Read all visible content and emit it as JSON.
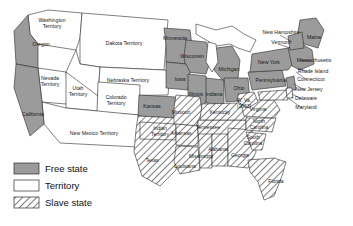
{
  "map": {
    "title": "United States free states, territories and slave states",
    "background_color": "#ffffff",
    "outline_color": "#2b2b2b"
  },
  "legend": {
    "items": [
      {
        "label": "Free state",
        "fill": "#9b9b9b",
        "pattern": "solid-gray"
      },
      {
        "label": "Territory",
        "fill": "#ffffff",
        "pattern": "solid-white"
      },
      {
        "label": "Slave state",
        "fill": "#ffffff",
        "pattern": "diagonal-hatch"
      }
    ]
  },
  "regions": {
    "free_states": [
      {
        "name": "Oregon",
        "label": "Oregon",
        "x": 41,
        "y": 45,
        "lines": [
          "Oregon"
        ]
      },
      {
        "name": "California",
        "label": "California",
        "x": 33,
        "y": 115,
        "lines": [
          "California"
        ]
      },
      {
        "name": "Kansas",
        "label": "Kansas",
        "x": 152,
        "y": 107,
        "lines": [
          "Kansas"
        ]
      },
      {
        "name": "Minnesota",
        "label": "Minnesota",
        "x": 175,
        "y": 39,
        "lines": [
          "Minnesota"
        ]
      },
      {
        "name": "Wisconsin",
        "label": "Wisconsin",
        "x": 192,
        "y": 57,
        "lines": [
          "Wisconsin"
        ]
      },
      {
        "name": "Iowa",
        "label": "Iowa",
        "x": 180,
        "y": 80,
        "lines": [
          "Iowa"
        ]
      },
      {
        "name": "Illinois",
        "label": "Illinois",
        "x": 196,
        "y": 95,
        "lines": [
          "Illinois"
        ]
      },
      {
        "name": "Michigan",
        "label": "Michigan",
        "x": 229,
        "y": 70,
        "lines": [
          "Michigan"
        ]
      },
      {
        "name": "Indiana",
        "label": "Indiana",
        "x": 214,
        "y": 95,
        "lines": [
          "Indiana"
        ]
      },
      {
        "name": "Ohio",
        "label": "Ohio",
        "x": 239,
        "y": 89,
        "lines": [
          "Ohio"
        ]
      },
      {
        "name": "Pennsylvania",
        "label": "Pennsylvania",
        "x": 271,
        "y": 81,
        "lines": [
          "Pennsylvania"
        ]
      },
      {
        "name": "New York",
        "label": "New York",
        "x": 269,
        "y": 63,
        "lines": [
          "New York"
        ]
      },
      {
        "name": "Maine",
        "label": "Maine",
        "x": 314,
        "y": 38,
        "lines": [
          "Maine"
        ]
      },
      {
        "name": "New Hampshire",
        "label": "New Hampshire"
      },
      {
        "name": "Vermont",
        "label": "Vermont"
      },
      {
        "name": "Massachusetts",
        "label": "Massachusetts"
      },
      {
        "name": "Rhode Island",
        "label": "Rhode Island"
      },
      {
        "name": "Connecticut",
        "label": "Connecticut"
      },
      {
        "name": "New Jersey",
        "label": "New Jersey"
      }
    ],
    "territories": [
      {
        "name": "Washington Territory",
        "lines": [
          "Washington",
          "Territory"
        ],
        "x": 52,
        "y": 24
      },
      {
        "name": "Dakota Territory",
        "lines": [
          "Dakota Territory"
        ],
        "x": 124,
        "y": 44
      },
      {
        "name": "Nebraska Territory",
        "lines": [
          "Nebraska Territory"
        ],
        "x": 128,
        "y": 81
      },
      {
        "name": "Nevada Territory",
        "lines": [
          "Nevada",
          "Territory"
        ],
        "x": 50,
        "y": 82
      },
      {
        "name": "Utah Territory",
        "lines": [
          "Utah",
          "Territory"
        ],
        "x": 78,
        "y": 92
      },
      {
        "name": "Colorado Territory",
        "lines": [
          "Colorado",
          "Territory"
        ],
        "x": 116,
        "y": 101
      },
      {
        "name": "New Mexico Territory",
        "lines": [
          "New Mexico Territory"
        ],
        "x": 94,
        "y": 134
      }
    ],
    "slave_states": [
      {
        "name": "Texas",
        "label": "Texas",
        "x": 152,
        "y": 161,
        "lines": [
          "Texas"
        ]
      },
      {
        "name": "Indian Territory",
        "lines": [
          "Indian",
          "Territory"
        ],
        "x": 160,
        "y": 132
      },
      {
        "name": "Missouri",
        "label": "Missouri",
        "x": 181,
        "y": 113,
        "lines": [
          "Missouri"
        ]
      },
      {
        "name": "Arkansas",
        "label": "Arkansas",
        "x": 181,
        "y": 134,
        "lines": [
          "Arkansas"
        ]
      },
      {
        "name": "Louisiana",
        "label": "Louisiana",
        "x": 185,
        "y": 167,
        "lines": [
          "Louisiana"
        ]
      },
      {
        "name": "Mississippi",
        "label": "Mississippi",
        "x": 201,
        "y": 157,
        "lines": [
          "Mississippi"
        ]
      },
      {
        "name": "Alabama",
        "label": "Alabama",
        "x": 218,
        "y": 150,
        "lines": [
          "Alabama"
        ]
      },
      {
        "name": "Tennessee",
        "label": "Tennessee",
        "x": 208,
        "y": 128,
        "lines": [
          "Tennessee"
        ]
      },
      {
        "name": "Kentucky",
        "label": "Kentucky",
        "x": 220,
        "y": 113,
        "lines": [
          "Kentucky"
        ]
      },
      {
        "name": "Georgia",
        "label": "Georgia",
        "x": 240,
        "y": 156,
        "lines": [
          "Georgia"
        ]
      },
      {
        "name": "Florida",
        "label": "Florida",
        "x": 276,
        "y": 182,
        "lines": [
          "Florida"
        ]
      },
      {
        "name": "South Carolina",
        "lines": [
          "South",
          "Carolina"
        ],
        "x": 253,
        "y": 141
      },
      {
        "name": "North Carolina",
        "lines": [
          "North",
          "Carolina"
        ],
        "x": 259,
        "y": 125
      },
      {
        "name": "Virginia",
        "label": "Virginia",
        "x": 258,
        "y": 110,
        "lines": [
          "Virginia"
        ]
      },
      {
        "name": "West Virginia",
        "lines": [
          "W. Va.",
          "(1863)"
        ],
        "x": 244,
        "y": 104
      },
      {
        "name": "Delaware",
        "label": "Delaware"
      },
      {
        "name": "Maryland",
        "label": "Maryland"
      }
    ]
  },
  "callout_labels": [
    {
      "name": "New Hampshire",
      "text": "New Hampshire",
      "x": 281,
      "y": 33
    },
    {
      "name": "Vermont",
      "text": "Vermont",
      "x": 281,
      "y": 43
    },
    {
      "name": "Massachusetts",
      "text": "Massachusetts",
      "x": 314,
      "y": 61
    },
    {
      "name": "Rhode Island",
      "text": "Rhode Island",
      "x": 313,
      "y": 72
    },
    {
      "name": "Connecticut",
      "text": "Connecticut",
      "x": 311,
      "y": 80
    },
    {
      "name": "New Jersey",
      "text": "New Jersey",
      "x": 309,
      "y": 90
    },
    {
      "name": "Delaware",
      "text": "Delaware",
      "x": 306,
      "y": 99
    },
    {
      "name": "Maryland",
      "text": "Maryland",
      "x": 306,
      "y": 108
    }
  ]
}
